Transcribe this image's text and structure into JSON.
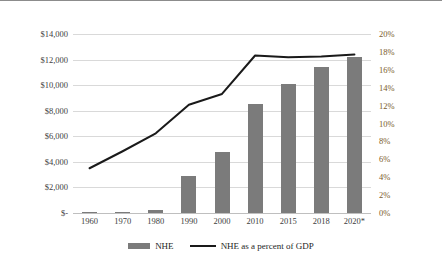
{
  "chart_data": {
    "type": "bar",
    "title": "",
    "subtitle": "",
    "xlabel": "",
    "ylabel": "",
    "grid": true,
    "legend_position": "bottom",
    "categories": [
      "1960",
      "1970",
      "1980",
      "1990",
      "2000",
      "2010",
      "2015",
      "2018",
      "2020*"
    ],
    "series": [
      {
        "name": "NHE",
        "type": "bar",
        "axis": "left",
        "unit": "billions of dollars",
        "values": [
          27,
          74,
          255,
          2900,
          4800,
          8500,
          10100,
          11400,
          12200
        ],
        "color": "#7b7b7b"
      },
      {
        "name": "NHE as a percent of GDP",
        "type": "line",
        "axis": "right",
        "unit": "percent",
        "values": [
          5.0,
          6.9,
          8.9,
          12.1,
          13.3,
          17.6,
          17.4,
          17.5,
          17.7
        ],
        "color": "#1a1a1a"
      }
    ],
    "left_axis": {
      "ticks": [
        "$-",
        "$2,000",
        "$4,000",
        "$6,000",
        "$8,000",
        "$10,000",
        "$12,000",
        "$14,000"
      ],
      "tick_values": [
        0,
        2000,
        4000,
        6000,
        8000,
        10000,
        12000,
        14000
      ],
      "ylim": [
        0,
        14000
      ]
    },
    "right_axis": {
      "ticks": [
        "0%",
        "2%",
        "4%",
        "6%",
        "8%",
        "10%",
        "12%",
        "14%",
        "16%",
        "18%",
        "20%"
      ],
      "tick_values": [
        0,
        2,
        4,
        6,
        8,
        10,
        12,
        14,
        16,
        18,
        20
      ],
      "ylim": [
        0,
        20
      ]
    }
  },
  "legend": [
    {
      "label": "NHE",
      "marker": "bar-swatch"
    },
    {
      "label": "NHE as a percent of GDP",
      "marker": "line-swatch"
    }
  ],
  "colors": {
    "bar": "#7b7b7b",
    "line": "#1a1a1a",
    "grid": "#d9d9d9",
    "left_tick_text": "#404040",
    "right_tick_text": "#7a5a2a",
    "background": "#ffffff",
    "top_border": "#8c8c8c"
  }
}
